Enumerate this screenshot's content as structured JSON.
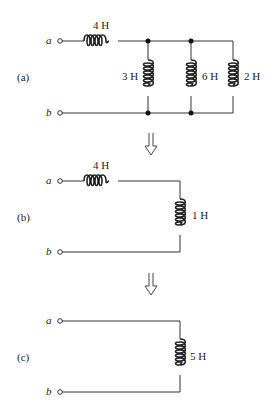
{
  "diagram": {
    "type": "circuit-reduction",
    "steps": [
      {
        "id": "a",
        "label": "(a)",
        "terminals": [
          "a",
          "b"
        ],
        "series_inductor": "4 H",
        "parallel_inductors": [
          "3 H",
          "6 H",
          "2 H"
        ]
      },
      {
        "id": "b",
        "label": "(b)",
        "terminals": [
          "a",
          "b"
        ],
        "series_inductor": "4 H",
        "shunt_inductor": "1 H"
      },
      {
        "id": "c",
        "label": "(c)",
        "terminals": [
          "a",
          "b"
        ],
        "equivalent_inductor": "5 H"
      }
    ],
    "arrows": [
      "down-arrow-1",
      "down-arrow-2"
    ]
  },
  "a": {
    "label": "(a)",
    "term_a": "a",
    "term_b": "b",
    "L_series": "4 H",
    "L1": "3 H",
    "L2": "6 H",
    "L3": "2 H"
  },
  "b": {
    "label": "(b)",
    "term_a": "a",
    "term_b": "b",
    "L_series": "4 H",
    "L_shunt": "1 H"
  },
  "c": {
    "label": "(c)",
    "term_a": "a",
    "term_b": "b",
    "L_eq": "5 H"
  }
}
